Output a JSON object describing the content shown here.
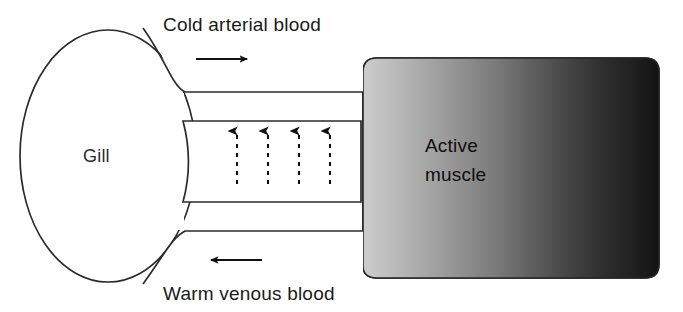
{
  "figure": {
    "background_color": "#ffffff",
    "width": 683,
    "height": 312
  },
  "labels": {
    "top_flow": "Cold arterial blood",
    "bottom_flow": "Warm venous blood",
    "gill": "Gill",
    "muscle_line1": "Active",
    "muscle_line2": "muscle"
  },
  "shapes": {
    "gill": {
      "name": "Gill",
      "type": "ellipse",
      "cx": 108,
      "cy": 156,
      "rx": 88,
      "ry": 126,
      "fill": "#ffffff",
      "stroke": "#2b2b2b"
    },
    "muscle_block": {
      "name": "Active muscle",
      "type": "rounded-rect",
      "x": 363,
      "y": 58,
      "width": 296,
      "height": 220,
      "corner_radius": 14,
      "gradient_from": "#c9c9c9",
      "gradient_to": "#1a1a1a",
      "stroke": "#262626"
    },
    "arterial_vessel": {
      "name": "Cold arterial blood vessel",
      "type": "channel",
      "fill": "#ffffff"
    },
    "venous_vessel": {
      "name": "Warm venous blood vessel",
      "type": "channel",
      "fill": "#ffffff"
    },
    "heat_exchange_channel": {
      "name": "Heat exchange channel",
      "type": "rect",
      "x": 182,
      "y": 121,
      "width": 179,
      "height": 81,
      "fill": "#ffffff",
      "stroke": "#2b2b2b"
    }
  },
  "arrows": {
    "arterial": {
      "direction": "right",
      "x_start": 196,
      "x_end": 253,
      "y": 59,
      "style": "solid",
      "color": "#111111"
    },
    "venous": {
      "direction": "left",
      "x_start": 262,
      "x_end": 204,
      "y": 260,
      "style": "solid",
      "color": "#111111"
    },
    "heat_transfer": {
      "direction": "up",
      "style": "dashed",
      "count": 4,
      "x_positions": [
        237,
        268,
        299,
        330
      ],
      "y_tail": 184,
      "y_head": 125,
      "color": "#111111"
    }
  },
  "colors": {
    "outline": "#2b2b2b",
    "text": "#1a1a1a",
    "muscle_light": "#c9c9c9",
    "muscle_dark": "#1a1a1a",
    "page_background": "#ffffff"
  }
}
